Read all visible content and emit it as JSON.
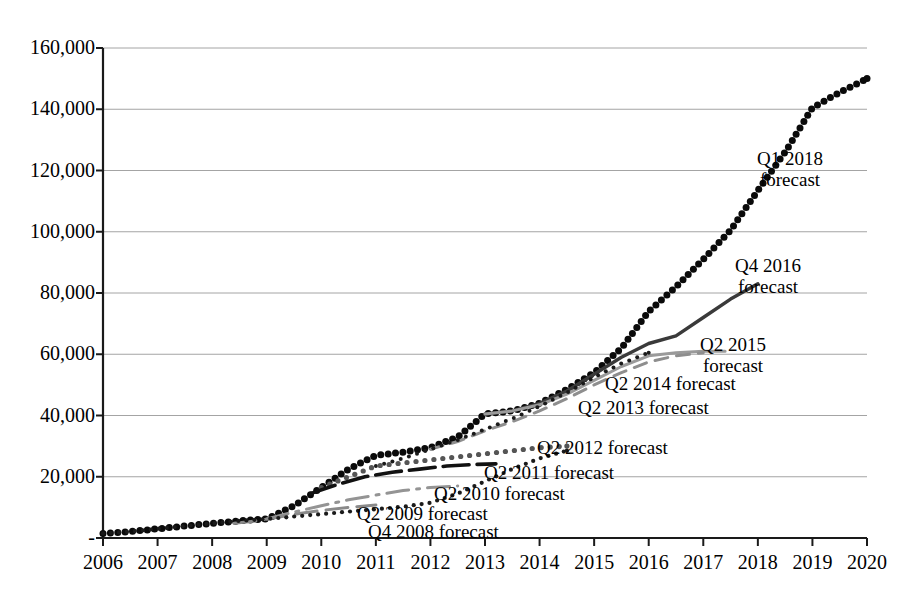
{
  "chart_data": {
    "type": "line",
    "title": "",
    "xlabel": "",
    "ylabel": "",
    "xlim": [
      2006,
      2020
    ],
    "ylim": [
      0,
      160000
    ],
    "grid": true,
    "legend_position": "inline-annotations",
    "x_tick_labels": [
      "2006",
      "2007",
      "2008",
      "2009",
      "2010",
      "2011",
      "2012",
      "2013",
      "2014",
      "2015",
      "2016",
      "2017",
      "2018",
      "2019",
      "2020"
    ],
    "y_tick_labels": [
      "-",
      "20,000",
      "40,000",
      "60,000",
      "80,000",
      "100,000",
      "120,000",
      "140,000",
      "160,000"
    ],
    "y_tick_values": [
      0,
      20000,
      40000,
      60000,
      80000,
      100000,
      120000,
      140000,
      160000
    ],
    "series": [
      {
        "name": "Q1 2018 forecast",
        "style": "dotted-thick-marker",
        "color": "#0a0a0a",
        "x": [
          2006.0,
          2006.5,
          2007.0,
          2007.5,
          2008.0,
          2008.5,
          2009.0,
          2009.5,
          2010.0,
          2010.5,
          2011.0,
          2011.5,
          2012.0,
          2012.5,
          2013.0,
          2013.5,
          2014.0,
          2014.5,
          2015.0,
          2015.5,
          2016.0,
          2016.5,
          2017.0,
          2017.5,
          2018.0,
          2018.5,
          2019.0,
          2019.5,
          2020.0
        ],
        "values": [
          1500,
          2100,
          3000,
          3900,
          4800,
          5600,
          6200,
          10500,
          16500,
          22500,
          27000,
          28000,
          29500,
          33000,
          40500,
          41500,
          44000,
          48500,
          54000,
          62000,
          74000,
          82000,
          91000,
          100500,
          113500,
          126000,
          140500,
          145500,
          150000
        ]
      },
      {
        "name": "Q4 2016 forecast",
        "style": "solid-thick",
        "color": "#3a3a3a",
        "x": [
          2013.0,
          2013.5,
          2014.0,
          2014.5,
          2015.0,
          2015.5,
          2016.0,
          2016.5,
          2017.0,
          2017.5,
          2018.0
        ],
        "values": [
          40500,
          41500,
          44000,
          48000,
          53500,
          59000,
          63500,
          66000,
          72000,
          78000,
          83000
        ]
      },
      {
        "name": "Q2 2015 forecast",
        "style": "solid-gray",
        "color": "#9a9a9a",
        "x": [
          2013.0,
          2013.5,
          2014.0,
          2014.5,
          2015.0,
          2015.5,
          2016.0,
          2016.5,
          2017.0,
          2017.4
        ],
        "values": [
          40500,
          41500,
          43500,
          47000,
          51500,
          56000,
          59500,
          60500,
          61000,
          61000
        ]
      },
      {
        "name": "Q2 2014 forecast",
        "style": "dashed-gray",
        "color": "#8e8e8e",
        "x": [
          2012.0,
          2012.5,
          2013.0,
          2013.5,
          2014.0,
          2014.5,
          2015.0,
          2015.5,
          2016.0,
          2016.5,
          2017.0
        ],
        "values": [
          29000,
          31500,
          35000,
          38000,
          41500,
          45500,
          50000,
          54000,
          57500,
          59500,
          60500
        ]
      },
      {
        "name": "Q2 2013 forecast",
        "style": "dotted-fine",
        "color": "#1a1a1a",
        "x": [
          2011.0,
          2011.5,
          2012.0,
          2012.5,
          2013.0,
          2013.5,
          2014.0,
          2014.5,
          2015.0,
          2015.5,
          2016.0
        ],
        "values": [
          23500,
          26000,
          29000,
          32000,
          35500,
          39000,
          43000,
          47500,
          52500,
          57000,
          60500
        ]
      },
      {
        "name": "Q2 2012 forecast",
        "style": "dotted-round-gray",
        "color": "#555555",
        "x": [
          2010.0,
          2010.5,
          2011.0,
          2011.5,
          2012.0,
          2012.5,
          2013.0,
          2013.5,
          2014.0,
          2014.5
        ],
        "values": [
          16500,
          20000,
          23500,
          24500,
          25500,
          26500,
          27500,
          28500,
          29500,
          30000
        ]
      },
      {
        "name": "Q2 2011 forecast",
        "style": "dashed-black",
        "color": "#111111",
        "x": [
          2009.8,
          2010.3,
          2010.8,
          2011.3,
          2011.8,
          2012.3,
          2012.8,
          2013.2
        ],
        "values": [
          14500,
          17500,
          20000,
          21500,
          22500,
          23500,
          24000,
          24200
        ]
      },
      {
        "name": "Q2 2010 forecast",
        "style": "dashdot-gray",
        "color": "#949494",
        "x": [
          2009.0,
          2009.5,
          2010.0,
          2010.5,
          2011.0,
          2011.5,
          2012.0,
          2012.5
        ],
        "values": [
          6200,
          8500,
          10500,
          12500,
          14000,
          15500,
          16500,
          17000
        ]
      },
      {
        "name": "Q2 2009 forecast",
        "style": "solid-short-gray",
        "color": "#8a8a8a",
        "x": [
          2008.4,
          2008.8,
          2009.2,
          2009.6,
          2010.0,
          2010.5,
          2011.0
        ],
        "values": [
          4800,
          5600,
          6800,
          8000,
          9000,
          10000,
          10800
        ]
      },
      {
        "name": "Q4 2008 forecast",
        "style": "dotted-small",
        "color": "#1a1a1a",
        "x": [
          2006.0,
          2006.5,
          2007.0,
          2007.5,
          2008.0,
          2008.5,
          2009.0,
          2009.5,
          2010.0,
          2010.5,
          2011.0,
          2011.5,
          2012.0,
          2012.5,
          2013.0,
          2013.5,
          2014.0,
          2014.5
        ],
        "values": [
          1500,
          2100,
          3000,
          3900,
          4800,
          5600,
          6200,
          7000,
          7800,
          8600,
          9400,
          10200,
          11500,
          14500,
          18500,
          22500,
          26000,
          28500
        ]
      }
    ],
    "annotations": [
      {
        "name": "q1-2018-forecast",
        "lines": [
          "Q1 2018",
          "forecast"
        ]
      },
      {
        "name": "q4-2016-forecast",
        "lines": [
          "Q4 2016",
          "forecast"
        ]
      },
      {
        "name": "q2-2015-forecast",
        "lines": [
          "Q2 2015",
          "forecast"
        ]
      },
      {
        "name": "q2-2014-forecast",
        "lines": [
          "Q2 2014 forecast"
        ]
      },
      {
        "name": "q2-2013-forecast",
        "lines": [
          "Q2 2013 forecast"
        ]
      },
      {
        "name": "q2-2012-forecast",
        "lines": [
          "Q2 2012 forecast"
        ]
      },
      {
        "name": "q2-2011-forecast",
        "lines": [
          "Q2 2011 forecast"
        ]
      },
      {
        "name": "q2-2010-forecast",
        "lines": [
          "Q2 2010 forecast"
        ]
      },
      {
        "name": "q2-2009-forecast",
        "lines": [
          "Q2 2009 forecast"
        ]
      },
      {
        "name": "q4-2008-forecast",
        "lines": [
          "Q4 2008 forecast"
        ]
      }
    ]
  },
  "annotations_text": {
    "q1_2018_l1": "Q1 2018",
    "q1_2018_l2": "forecast",
    "q4_2016_l1": "Q4 2016",
    "q4_2016_l2": "forecast",
    "q2_2015_l1": "Q2 2015",
    "q2_2015_l2": "forecast",
    "q2_2014": "Q2 2014 forecast",
    "q2_2013": "Q2 2013 forecast",
    "q2_2012": "Q2 2012 forecast",
    "q2_2011": "Q2 2011 forecast",
    "q2_2010": "Q2 2010 forecast",
    "q2_2009": "Q2 2009 forecast",
    "q4_2008": "Q4 2008 forecast"
  }
}
